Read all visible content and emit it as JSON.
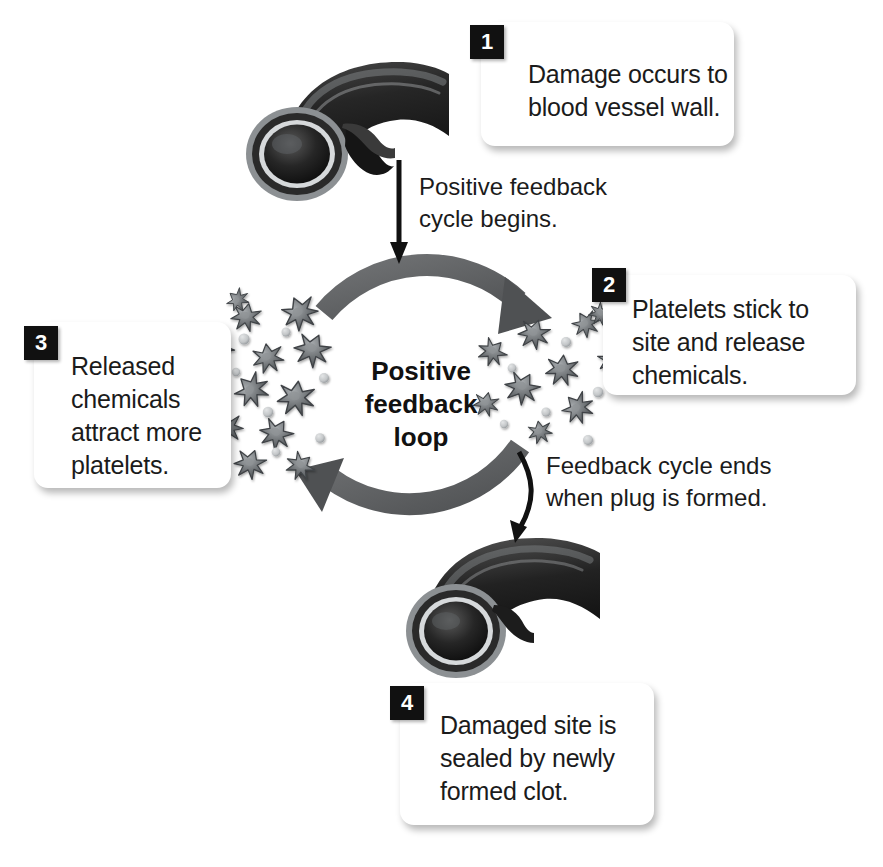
{
  "diagram": {
    "center_label": "Positive\nfeedback\nloop",
    "colors": {
      "background": "#ffffff",
      "text": "#1b1b1b",
      "badge_background": "#111111",
      "badge_text": "#ffffff",
      "loop_arrow": "#555759",
      "vessel_dark": "#2b2b2b",
      "vessel_light": "#b9bcbe",
      "platelet": "#6e7174",
      "straight_arrow": "#111111"
    }
  },
  "steps": [
    {
      "number": "1",
      "text": "Damage occurs to\nblood vessel wall."
    },
    {
      "number": "2",
      "text": "Platelets stick to\nsite and release\nchemicals."
    },
    {
      "number": "3",
      "text": "Released\nchemicals\nattract more\nplatelets."
    },
    {
      "number": "4",
      "text": "Damaged site is\nsealed by newly\nformed clot."
    }
  ],
  "connectors": [
    {
      "name": "cycle-begins",
      "text": "Positive feedback\ncycle begins."
    },
    {
      "name": "cycle-ends",
      "text": "Feedback cycle ends\nwhen plug is formed."
    }
  ],
  "illustrations": [
    {
      "name": "damaged-blood-vessel",
      "caption": "Blood vessel with damaged wall"
    },
    {
      "name": "sealed-blood-vessel",
      "caption": "Blood vessel sealed by clot"
    },
    {
      "name": "platelet-cluster-left",
      "caption": "Dense cluster of activated platelets"
    },
    {
      "name": "platelet-cluster-right",
      "caption": "Scattered activated platelets"
    }
  ]
}
